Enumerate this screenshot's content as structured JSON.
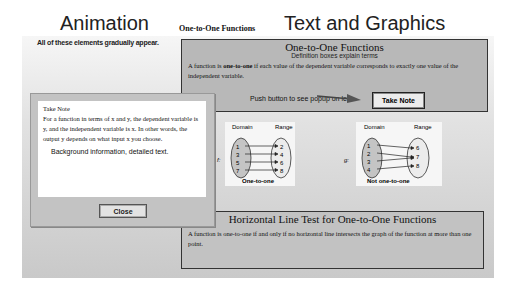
{
  "left": {
    "title": "Animation",
    "subtitle": "All of these elements gradually appear."
  },
  "right": {
    "small_label": "One-to-One Functions",
    "title": "Text and Graphics"
  },
  "definition_box": {
    "heading": "One-to-One Functions",
    "subheading": "Definition boxes explain terms",
    "text_prefix": "A function is ",
    "text_bold": "one-to-one",
    "text_suffix": " if each value of the dependent variable corresponds to exactly one value of the independent variable.",
    "push_text": "Push button to see popup on left.",
    "take_note_button": "Take Note"
  },
  "diagram_f": {
    "function_label": "f:",
    "domain_label": "Domain",
    "range_label": "Range",
    "domain": [
      "1",
      "3",
      "5",
      "7"
    ],
    "range": [
      "2",
      "4",
      "6",
      "8"
    ],
    "caption": "One-to-one"
  },
  "diagram_g": {
    "function_label": "g:",
    "domain_label": "Domain",
    "range_label": "Range",
    "domain": [
      "1",
      "2",
      "3",
      "4"
    ],
    "range": [
      "6",
      "7",
      "8"
    ],
    "caption": "Not one-to-one"
  },
  "hlt_box": {
    "heading": "Horizontal Line Test for One-to-One Functions",
    "text": "A function is one-to-one if and only if no horizontal line intersects the graph of the function at more than one point."
  },
  "popup": {
    "title": "Take Note",
    "body": "For a function in terms of x and y, the dependent variable is y, and the independent variable is x. In other words, the output y depends on what input x you choose.",
    "background_text": "Background information, detailed text.",
    "close_button": "Close"
  }
}
